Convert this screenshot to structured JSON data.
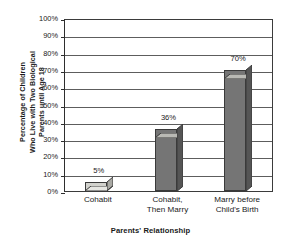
{
  "chart_data": {
    "type": "bar",
    "title": "",
    "subtitle": "",
    "categories": [
      "Cohabit",
      "Cohabit, Then Marry",
      "Marry before Child's Birth"
    ],
    "category_lines": [
      [
        "Cohabit"
      ],
      [
        "Cohabit,",
        "Then Marry"
      ],
      [
        "Marry before",
        "Child's Birth"
      ]
    ],
    "values": [
      5,
      36,
      70
    ],
    "data_labels": [
      "5%",
      "36%",
      "70%"
    ],
    "xlabel": "Parents' Relationship",
    "ylabel": "Percentage of Children Who Live with Two Biological Parents until Age 18",
    "ylabel_lines": [
      "Percentage of Children",
      "Who Live with Two Biological",
      "Parents until Age 18"
    ],
    "ylim": [
      0,
      100
    ],
    "ytick_step": 10,
    "ytick_labels": [
      "100%",
      "90%",
      "80%",
      "70%",
      "60%",
      "50%",
      "40%",
      "30%",
      "20%",
      "10%",
      "0%"
    ],
    "ytick_values": [
      100,
      90,
      80,
      70,
      60,
      50,
      40,
      30,
      20,
      10,
      0
    ],
    "grid": true,
    "grid_axis": "y",
    "legend": false,
    "legend_position": "none",
    "bar_style": "3d",
    "colors": {
      "bar_fill_small": "#d2d2cd",
      "bar_fill": "#757575",
      "bar_top": "#b9b9b4",
      "bar_top_small": "#e6e6e2",
      "bar_side": "#555555",
      "bar_side_small": "#a9a9a4",
      "bar_outline": "#3a3a3a",
      "gridline": "#5d5d5d",
      "axis": "#2e2e2e",
      "text": "#1a1a1a",
      "background": "#ffffff"
    }
  }
}
